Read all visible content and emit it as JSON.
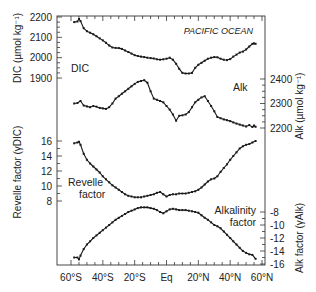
{
  "chart_data": [
    {
      "type": "line",
      "panel": "dic-alk",
      "title": "",
      "annotation": "PACIFIC OCEAN",
      "xlabel": "",
      "x_ticks": [
        -60,
        -40,
        -20,
        0,
        20,
        40,
        60
      ],
      "x_tick_labels": [
        "60°S",
        "40°S",
        "20°S",
        "Eq",
        "20°N",
        "40°N",
        "60°N"
      ],
      "xlim": [
        -62,
        62
      ],
      "series": [
        {
          "name": "DIC",
          "label": "DIC",
          "axis": "left",
          "ylabel": "DIC (µmol kg⁻¹)",
          "ylim": [
            1850,
            2200
          ],
          "y_ticks": [
            1900,
            2000,
            2100,
            2200
          ],
          "x": [
            -58,
            -56,
            -55,
            -54,
            -52,
            -50,
            -48,
            -46,
            -44,
            -42,
            -40,
            -38,
            -36,
            -34,
            -32,
            -30,
            -28,
            -26,
            -24,
            -22,
            -20,
            -18,
            -16,
            -14,
            -12,
            -10,
            -8,
            -6,
            -4,
            -2,
            0,
            2,
            4,
            6,
            8,
            10,
            12,
            14,
            16,
            18,
            20,
            22,
            24,
            26,
            28,
            30,
            32,
            34,
            36,
            38,
            40,
            42,
            44,
            46,
            48,
            50,
            52,
            54,
            55,
            56
          ],
          "y": [
            2175,
            2178,
            2190,
            2180,
            2145,
            2130,
            2123,
            2115,
            2105,
            2095,
            2085,
            2073,
            2060,
            2050,
            2048,
            2047,
            2043,
            2035,
            2028,
            2020,
            2012,
            2008,
            2005,
            2003,
            2000,
            1998,
            1996,
            1992,
            1990,
            1992,
            1995,
            2000,
            1990,
            1970,
            1945,
            1925,
            1922,
            1922,
            1925,
            1950,
            1965,
            1975,
            1985,
            1995,
            2000,
            2003,
            2002,
            1995,
            1990,
            1988,
            1993,
            2005,
            2015,
            2025,
            2030,
            2040,
            2055,
            2068,
            2070,
            2068
          ]
        },
        {
          "name": "Alk",
          "label": "Alk",
          "axis": "right",
          "ylabel": "Alk (µmol kg⁻¹)",
          "ylim": [
            2150,
            2500
          ],
          "y_ticks": [
            2200,
            2300,
            2400
          ],
          "x": [
            -58,
            -56,
            -54,
            -52,
            -50,
            -48,
            -46,
            -44,
            -42,
            -40,
            -38,
            -36,
            -34,
            -32,
            -30,
            -28,
            -26,
            -24,
            -22,
            -20,
            -18,
            -16,
            -14,
            -12,
            -10,
            -8,
            -6,
            -4,
            -2,
            0,
            2,
            4,
            6,
            8,
            10,
            12,
            14,
            16,
            18,
            20,
            22,
            24,
            26,
            28,
            30,
            32,
            34,
            36,
            38,
            40,
            42,
            44,
            46,
            48,
            50,
            52,
            54,
            55,
            56
          ],
          "y": [
            2300,
            2302,
            2310,
            2292,
            2288,
            2285,
            2290,
            2287,
            2282,
            2280,
            2278,
            2285,
            2300,
            2320,
            2330,
            2340,
            2350,
            2360,
            2370,
            2380,
            2388,
            2392,
            2395,
            2385,
            2350,
            2320,
            2315,
            2310,
            2305,
            2290,
            2275,
            2255,
            2230,
            2250,
            2252,
            2255,
            2265,
            2285,
            2305,
            2315,
            2325,
            2330,
            2310,
            2290,
            2268,
            2245,
            2240,
            2235,
            2232,
            2228,
            2223,
            2218,
            2214,
            2210,
            2206,
            2212,
            2204,
            2210,
            2205
          ]
        }
      ]
    },
    {
      "type": "line",
      "panel": "buffer-factors",
      "xlabel": "",
      "x_ticks": [
        -60,
        -40,
        -20,
        0,
        20,
        40,
        60
      ],
      "x_tick_labels": [
        "60°S",
        "40°S",
        "20°S",
        "Eq",
        "20°N",
        "40°N",
        "60°N"
      ],
      "xlim": [
        -62,
        62
      ],
      "series": [
        {
          "name": "Revelle factor",
          "label_lines": [
            "Revelle",
            "factor"
          ],
          "axis": "left",
          "ylabel": "Revelle factor (γDIC)",
          "ylim": [
            7,
            16.5
          ],
          "y_ticks": [
            8,
            10,
            12,
            14,
            16
          ],
          "x": [
            -58,
            -56,
            -55,
            -54,
            -52,
            -50,
            -48,
            -46,
            -44,
            -42,
            -40,
            -38,
            -36,
            -34,
            -32,
            -30,
            -28,
            -26,
            -24,
            -22,
            -20,
            -18,
            -16,
            -14,
            -12,
            -10,
            -8,
            -6,
            -4,
            -2,
            0,
            2,
            4,
            6,
            8,
            10,
            12,
            14,
            16,
            18,
            20,
            22,
            24,
            26,
            28,
            30,
            32,
            34,
            36,
            38,
            40,
            42,
            44,
            46,
            48,
            50,
            52,
            54,
            56
          ],
          "y": [
            15.7,
            15.8,
            15.9,
            15.5,
            14.3,
            13.5,
            13.0,
            12.6,
            12.2,
            11.8,
            11.3,
            10.9,
            10.5,
            10.1,
            9.8,
            9.5,
            9.2,
            8.9,
            8.7,
            8.6,
            8.5,
            8.5,
            8.5,
            8.6,
            8.7,
            8.8,
            8.9,
            9.1,
            9.2,
            8.9,
            8.6,
            8.8,
            8.9,
            8.9,
            9.0,
            9.0,
            9.0,
            9.1,
            9.2,
            9.3,
            9.5,
            9.8,
            10.2,
            10.6,
            10.9,
            11.0,
            11.3,
            11.9,
            12.4,
            12.9,
            13.5,
            14.0,
            14.5,
            15.0,
            15.3,
            15.5,
            15.6,
            15.8,
            16.0
          ]
        },
        {
          "name": "Alkalinity factor",
          "label_lines": [
            "Alkalinity",
            "factor"
          ],
          "axis": "right",
          "ylabel": "Alk factor (γAlk)",
          "ylim": [
            -16,
            -7
          ],
          "y_ticks": [
            -8,
            -10,
            -12,
            -14,
            -16
          ],
          "x": [
            -58,
            -56,
            -55,
            -54,
            -52,
            -50,
            -48,
            -46,
            -44,
            -42,
            -40,
            -38,
            -36,
            -34,
            -32,
            -30,
            -28,
            -26,
            -24,
            -22,
            -20,
            -18,
            -16,
            -14,
            -12,
            -10,
            -8,
            -6,
            -4,
            -2,
            0,
            2,
            4,
            6,
            8,
            10,
            12,
            14,
            16,
            18,
            20,
            22,
            24,
            26,
            28,
            30,
            32,
            34,
            36,
            38,
            40,
            42,
            44,
            46,
            48,
            50,
            52,
            54,
            56
          ],
          "y": [
            -15.0,
            -15.0,
            -15.3,
            -14.7,
            -13.7,
            -13.0,
            -12.5,
            -12.0,
            -11.6,
            -11.2,
            -10.8,
            -10.4,
            -10.0,
            -9.6,
            -9.2,
            -8.9,
            -8.6,
            -8.3,
            -8.0,
            -7.8,
            -7.6,
            -7.4,
            -7.3,
            -7.3,
            -7.3,
            -7.4,
            -7.5,
            -7.7,
            -8.0,
            -8.2,
            -7.9,
            -7.6,
            -7.5,
            -7.6,
            -7.7,
            -7.7,
            -7.7,
            -7.8,
            -7.9,
            -8.0,
            -8.1,
            -8.5,
            -8.9,
            -9.2,
            -9.6,
            -10.0,
            -10.2,
            -10.5,
            -11.0,
            -11.5,
            -12.0,
            -12.5,
            -13.0,
            -13.5,
            -14.0,
            -14.3,
            -14.5,
            -14.6,
            -15.2
          ]
        }
      ]
    }
  ],
  "labels": {
    "annotation": "PACIFIC OCEAN",
    "dic_series": "DIC",
    "alk_series": "Alk",
    "revelle_line1": "Revelle",
    "revelle_line2": "factor",
    "alkfactor_line1": "Alkalinity",
    "alkfactor_line2": "factor",
    "dic_axis": "DIC (µmol kg⁻¹)",
    "alk_axis": "Alk (µmol kg⁻¹)",
    "revelle_axis": "Revelle factor (γDIC)",
    "alkfactor_axis": "Alk factor (γAlk)"
  },
  "colors": {
    "line": "#1a1a1a",
    "axis": "#333333",
    "text": "#222222"
  }
}
